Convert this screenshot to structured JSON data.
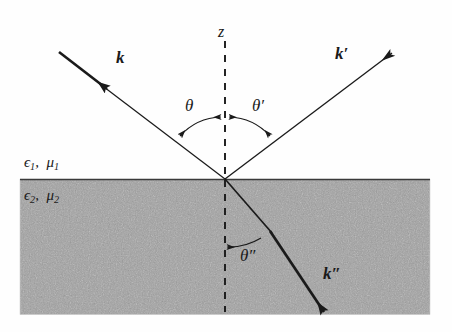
{
  "figure": {
    "type": "physics-diagram",
    "width": 452,
    "height": 332,
    "background_color": "#fefefe",
    "medium_fill_color": "#b9b9b9",
    "line_color": "#1a1a1a"
  },
  "labels": {
    "axis_z": "z",
    "incident_wavevector": "k",
    "reflected_wavevector": "k",
    "reflected_wavevector_prime": "′",
    "transmitted_wavevector": "k",
    "transmitted_wavevector_prime": "″",
    "angle_incidence": "θ",
    "angle_reflection": "θ",
    "angle_reflection_prime": "′",
    "angle_refraction": "θ",
    "angle_refraction_prime": "″",
    "medium1_epsilon": "ϵ",
    "medium1_epsilon_sub": "1",
    "medium1_comma": ",",
    "medium1_mu": "μ",
    "medium1_mu_sub": "1",
    "medium2_epsilon": "ϵ",
    "medium2_epsilon_sub": "2",
    "medium2_comma": ",",
    "medium2_mu": "μ",
    "medium2_mu_sub": "2"
  },
  "geometry": {
    "origin_x": 225,
    "origin_y": 179,
    "interface_y": 179,
    "interface_left_x": 20,
    "interface_right_x": 430,
    "medium2_bottom_y": 314,
    "z_axis_top_y": 40,
    "incident_start_x": 59,
    "incident_start_y": 51,
    "reflected_end_x": 393,
    "reflected_end_y": 51,
    "transmitted_end_x": 327,
    "transmitted_end_y": 316,
    "angle_incidence_deg": 40,
    "angle_reflection_deg": 40,
    "angle_refraction_deg": 22
  }
}
